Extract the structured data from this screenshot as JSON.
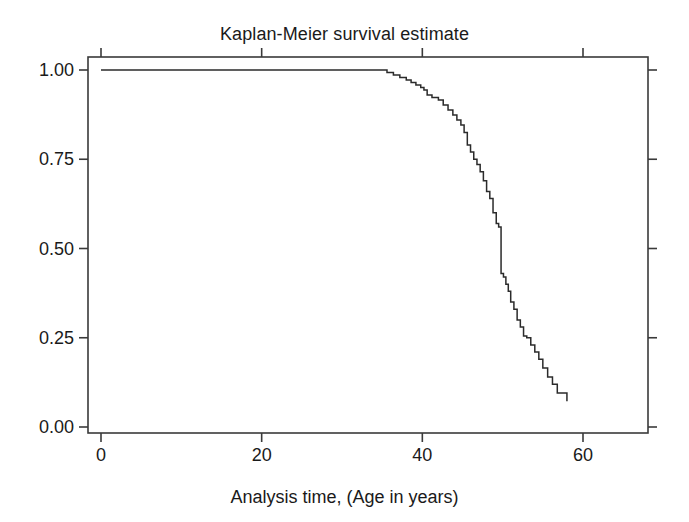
{
  "chart_data": {
    "type": "line",
    "title": "Kaplan-Meier survival estimate",
    "xlabel": "Analysis time, (Age in years)",
    "ylabel": "",
    "xlim": [
      0,
      60
    ],
    "ylim": [
      0,
      1.0
    ],
    "grid": false,
    "legend": null,
    "step_style": "post",
    "xticks": [
      {
        "value": 0,
        "label": "0"
      },
      {
        "value": 20,
        "label": "20"
      },
      {
        "value": 40,
        "label": "40"
      },
      {
        "value": 60,
        "label": "60"
      }
    ],
    "yticks": [
      {
        "value": 0.0,
        "label": "0.00"
      },
      {
        "value": 0.25,
        "label": "0.25"
      },
      {
        "value": 0.5,
        "label": "0.50"
      },
      {
        "value": 0.75,
        "label": "0.75"
      },
      {
        "value": 1.0,
        "label": "1.00"
      }
    ],
    "series": [
      {
        "name": "survival",
        "color": "#2b2b2b",
        "x": [
          0,
          34.5,
          35.6,
          36.4,
          37.2,
          38.0,
          38.6,
          39.2,
          39.8,
          40.2,
          40.6,
          41.2,
          42.0,
          42.6,
          43.2,
          43.8,
          44.3,
          44.8,
          45.2,
          45.6,
          46.0,
          46.4,
          46.8,
          47.2,
          47.6,
          48.0,
          48.4,
          48.8,
          49.2,
          49.5,
          49.8,
          50.1,
          50.4,
          50.7,
          51.0,
          51.4,
          51.8,
          52.2,
          52.6,
          53.0,
          53.5,
          54.0,
          54.5,
          55.0,
          55.6,
          56.2,
          56.8,
          58.0
        ],
        "y": [
          1.0,
          1.0,
          0.993,
          0.986,
          0.979,
          0.972,
          0.965,
          0.958,
          0.951,
          0.944,
          0.93,
          0.923,
          0.916,
          0.902,
          0.888,
          0.874,
          0.86,
          0.846,
          0.825,
          0.79,
          0.77,
          0.75,
          0.735,
          0.715,
          0.69,
          0.66,
          0.64,
          0.6,
          0.57,
          0.56,
          0.43,
          0.42,
          0.4,
          0.38,
          0.35,
          0.33,
          0.3,
          0.28,
          0.255,
          0.25,
          0.23,
          0.21,
          0.19,
          0.165,
          0.14,
          0.12,
          0.095,
          0.072
        ]
      }
    ]
  },
  "axes": {
    "frame_color": "#3a3a3a"
  }
}
